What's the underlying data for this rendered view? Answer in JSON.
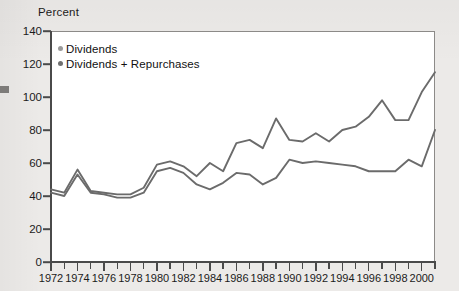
{
  "chart_data": {
    "type": "line",
    "title": "",
    "ylabel": "Percent",
    "xlabel": "",
    "ylim": [
      0,
      140
    ],
    "ytick_step": 20,
    "yticks": [
      0,
      20,
      40,
      60,
      80,
      100,
      120,
      140
    ],
    "xlim": [
      1972,
      2001
    ],
    "grid": false,
    "legend_position": "top-left",
    "x": [
      1972,
      1973,
      1974,
      1975,
      1976,
      1977,
      1978,
      1979,
      1980,
      1981,
      1982,
      1983,
      1984,
      1985,
      1986,
      1987,
      1988,
      1989,
      1990,
      1991,
      1992,
      1993,
      1994,
      1995,
      1996,
      1997,
      1998,
      1999,
      2000,
      2001
    ],
    "xtick_labels": [
      "1972",
      "1974",
      "1976",
      "1978",
      "1980",
      "1982",
      "1984",
      "1986",
      "1988",
      "1990",
      "1992",
      "1994",
      "1996",
      "1998",
      "2000"
    ],
    "series": [
      {
        "name": "Dividends + Repurchases",
        "color": "#6b6b6b",
        "values": [
          44,
          42,
          56,
          43,
          42,
          41,
          41,
          45,
          59,
          61,
          58,
          52,
          60,
          55,
          72,
          74,
          69,
          87,
          74,
          73,
          78,
          73,
          80,
          82,
          88,
          98,
          86,
          86,
          103,
          115
        ]
      },
      {
        "name": "Dividends",
        "color": "#6b6b6b",
        "values": [
          42,
          40,
          53,
          42,
          41,
          39,
          39,
          42,
          55,
          57,
          54,
          47,
          44,
          48,
          54,
          53,
          47,
          51,
          62,
          60,
          61,
          60,
          59,
          58,
          55,
          55,
          55,
          62,
          58,
          80
        ]
      }
    ]
  },
  "legend": {
    "items": [
      {
        "label": "Dividends",
        "color": "#9a9a9a"
      },
      {
        "label": "Dividends + Repurchases",
        "color": "#6f6f6f"
      }
    ]
  }
}
